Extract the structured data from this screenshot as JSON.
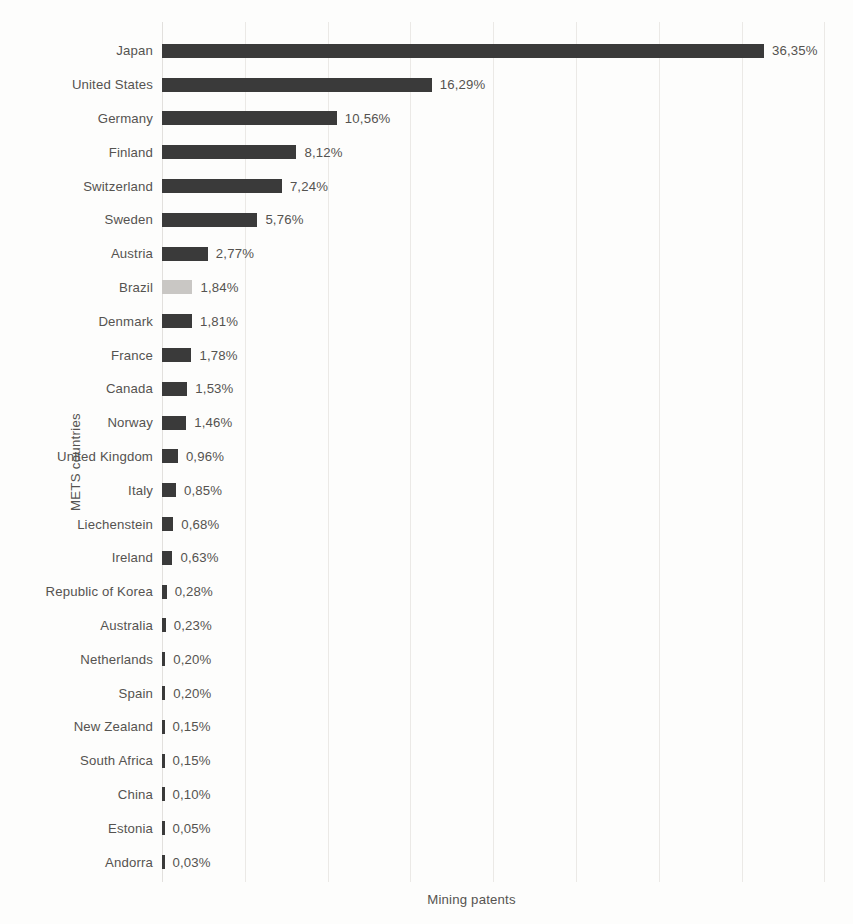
{
  "chart_data": {
    "type": "bar",
    "orientation": "horizontal",
    "title": "",
    "subtitle": "",
    "xlabel": "Mining patents",
    "ylabel": "METS countries",
    "decimal_separator": ",",
    "value_suffix": "%",
    "grid": {
      "vertical": true,
      "horizontal": false,
      "color": "#ebe9e6",
      "interval": 5
    },
    "legend": {
      "visible": false,
      "position": "none",
      "entries": []
    },
    "xlim": [
      0,
      40
    ],
    "bar_color": "#3a3a3a",
    "highlight_color": "#c9c7c4",
    "categories": [
      "Japan",
      "United States",
      "Germany",
      "Finland",
      "Switzerland",
      "Sweden",
      "Austria",
      "Brazil",
      "Denmark",
      "France",
      "Canada",
      "Norway",
      "United Kingdom",
      "Italy",
      "Liechenstein",
      "Ireland",
      "Republic of Korea",
      "Australia",
      "Netherlands",
      "Spain",
      "New Zealand",
      "South Africa",
      "China",
      "Estonia",
      "Andorra"
    ],
    "values": [
      36.35,
      16.29,
      10.56,
      8.12,
      7.24,
      5.76,
      2.77,
      1.84,
      1.81,
      1.78,
      1.53,
      1.46,
      0.96,
      0.85,
      0.68,
      0.63,
      0.28,
      0.23,
      0.2,
      0.2,
      0.15,
      0.15,
      0.1,
      0.05,
      0.03
    ],
    "value_labels": [
      "36,35%",
      "16,29%",
      "10,56%",
      "8,12%",
      "7,24%",
      "5,76%",
      "2,77%",
      "1,84%",
      "1,81%",
      "1,78%",
      "1,53%",
      "1,46%",
      "0,96%",
      "0,85%",
      "0,68%",
      "0,63%",
      "0,28%",
      "0,23%",
      "0,20%",
      "0,20%",
      "0,15%",
      "0,15%",
      "0,10%",
      "0,05%",
      "0,03%"
    ],
    "highlighted_categories": [
      "Brazil"
    ]
  }
}
